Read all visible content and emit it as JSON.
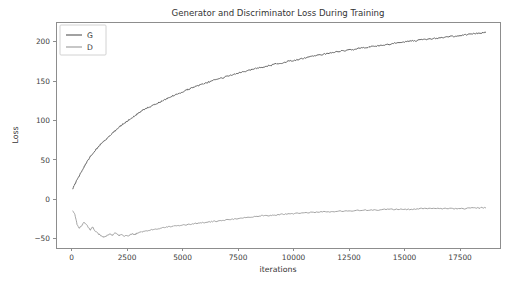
{
  "chart_data": {
    "type": "line",
    "title": "Generator and Discriminator Loss During Training",
    "xlabel": "iterations",
    "ylabel": "Loss",
    "xlim": [
      -700,
      19300
    ],
    "ylim": [
      -62,
      225
    ],
    "xticks": [
      0,
      2500,
      5000,
      7500,
      10000,
      12500,
      15000,
      17500
    ],
    "xticklabels": [
      "0",
      "2500",
      "5000",
      "7500",
      "10000",
      "12500",
      "15000",
      "17500"
    ],
    "yticks": [
      -50,
      0,
      50,
      100,
      150,
      200
    ],
    "yticklabels": [
      "−50",
      "0",
      "50",
      "100",
      "150",
      "200"
    ],
    "grid": false,
    "legend_position": "upper left",
    "legend_entries": [
      "G",
      "D"
    ],
    "colors": {
      "G": "#555555",
      "D": "#9a9a9a",
      "axis": "#8d8d8d",
      "text": "#333333",
      "background": "#ffffff"
    },
    "series": [
      {
        "name": "G",
        "color": "#555555",
        "x": [
          60,
          200,
          350,
          500,
          650,
          800,
          950,
          1100,
          1250,
          1400,
          1550,
          1700,
          1850,
          2000,
          2150,
          2300,
          2450,
          2600,
          2750,
          2900,
          3050,
          3200,
          3350,
          3500,
          3650,
          3800,
          3950,
          4100,
          4250,
          4400,
          4550,
          4700,
          4850,
          5000,
          5200,
          5400,
          5600,
          5800,
          6000,
          6200,
          6400,
          6600,
          6800,
          7000,
          7250,
          7500,
          7750,
          8000,
          8250,
          8500,
          8750,
          9000,
          9250,
          9500,
          9750,
          10000,
          10300,
          10600,
          10900,
          11200,
          11500,
          11800,
          12100,
          12400,
          12700,
          13000,
          13300,
          13600,
          13900,
          14200,
          14500,
          14800,
          15100,
          15400,
          15700,
          16000,
          16300,
          16600,
          16900,
          17200,
          17500,
          17800,
          18100,
          18400,
          18650
        ],
        "y": [
          14,
          22,
          30,
          38,
          45,
          52,
          58,
          63,
          68,
          72,
          76,
          80,
          84,
          88,
          92,
          95,
          98,
          101,
          104,
          107,
          110,
          113,
          115,
          117,
          119,
          121,
          123,
          125,
          127,
          129,
          131,
          133,
          134,
          136,
          139,
          141,
          143,
          145,
          147,
          149,
          151,
          153,
          154,
          156,
          158,
          160,
          162,
          164,
          166,
          167,
          169,
          170,
          172,
          173,
          175,
          176,
          178,
          180,
          182,
          183,
          185,
          186,
          188,
          189,
          190,
          192,
          193,
          194,
          195,
          196,
          198,
          199,
          200,
          201,
          202,
          203,
          204,
          205,
          206,
          207,
          208,
          209,
          210,
          211,
          212
        ]
      },
      {
        "name": "D",
        "color": "#9a9a9a",
        "x": [
          60,
          150,
          250,
          350,
          450,
          550,
          650,
          750,
          850,
          950,
          1050,
          1150,
          1250,
          1350,
          1450,
          1550,
          1650,
          1750,
          1850,
          1950,
          2050,
          2150,
          2250,
          2350,
          2450,
          2550,
          2650,
          2750,
          2850,
          2950,
          3050,
          3200,
          3400,
          3600,
          3800,
          4000,
          4200,
          4400,
          4600,
          4800,
          5000,
          5300,
          5600,
          5900,
          6200,
          6500,
          6800,
          7100,
          7400,
          7700,
          8000,
          8300,
          8600,
          8900,
          9200,
          9500,
          9800,
          10100,
          10500,
          10900,
          11300,
          11700,
          12100,
          12500,
          12900,
          13300,
          13700,
          14100,
          14500,
          14900,
          15300,
          15700,
          16100,
          16500,
          16900,
          17300,
          17700,
          18100,
          18400,
          18650
        ],
        "y": [
          -15,
          -19,
          -32,
          -37,
          -34,
          -30,
          -31,
          -36,
          -39,
          -35,
          -40,
          -42,
          -45,
          -47,
          -48,
          -47,
          -45,
          -44,
          -46,
          -43,
          -44,
          -46,
          -45,
          -47,
          -46,
          -47,
          -45,
          -44,
          -45,
          -43,
          -42,
          -41,
          -40,
          -39,
          -38,
          -37,
          -36,
          -35,
          -34,
          -34,
          -33,
          -32,
          -31,
          -30,
          -29,
          -28,
          -27,
          -26,
          -25,
          -24,
          -23,
          -22,
          -21,
          -21,
          -20,
          -19,
          -19,
          -18,
          -17,
          -17,
          -16,
          -16,
          -15,
          -15,
          -14,
          -14,
          -14,
          -13,
          -13,
          -13,
          -13,
          -12,
          -12,
          -12,
          -12,
          -12,
          -12,
          -11,
          -11,
          -11
        ]
      }
    ]
  },
  "figure": {
    "plot_area": {
      "left": 56,
      "top": 22,
      "right": 500,
      "bottom": 248
    }
  }
}
